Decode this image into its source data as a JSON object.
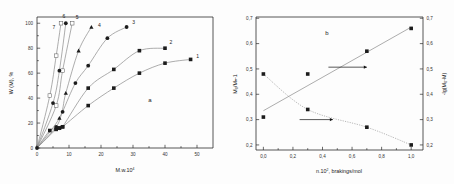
{
  "figure": {
    "panel_a_label": "a",
    "panel_b_label": "b"
  },
  "chart_data": [
    {
      "type": "line",
      "panel": "a",
      "title": "",
      "xlabel": "M.w.10",
      "xlabel_sup": "4",
      "ylabel": "W (M), %",
      "xlim": [
        0,
        55
      ],
      "ylim": [
        0,
        105
      ],
      "xticks": [
        0,
        10,
        20,
        30,
        40,
        50
      ],
      "yticks": [
        0,
        20,
        40,
        60,
        80,
        100
      ],
      "grid": false,
      "legend": "curve numbers 1-7 placed at curve ends",
      "series": [
        {
          "name": "1",
          "label": "1",
          "marker": "square",
          "x": [
            0,
            4,
            6,
            7,
            8,
            16,
            24,
            32,
            40,
            48
          ],
          "y": [
            0,
            14,
            15,
            16,
            17,
            34,
            48,
            60,
            68,
            71
          ]
        },
        {
          "name": "2",
          "label": "2",
          "marker": "square",
          "x": [
            0,
            6,
            7,
            8,
            16,
            24,
            32,
            40
          ],
          "y": [
            0,
            15,
            16,
            17,
            48,
            63,
            78,
            80
          ]
        },
        {
          "name": "3",
          "label": "3",
          "marker": "circle",
          "x": [
            0,
            6,
            8,
            12,
            16,
            22,
            28
          ],
          "y": [
            0,
            17,
            29,
            52,
            66,
            88,
            97
          ]
        },
        {
          "name": "4",
          "label": "4",
          "marker": "triangle",
          "x": [
            0,
            7,
            9,
            13,
            17
          ],
          "y": [
            0,
            24,
            44,
            78,
            97
          ]
        },
        {
          "name": "5",
          "label": "5",
          "marker": "open",
          "x": [
            0,
            6,
            8,
            11
          ],
          "y": [
            0,
            34,
            62,
            100
          ]
        },
        {
          "name": "6",
          "label": "6",
          "marker": "circle",
          "x": [
            0,
            5,
            7,
            9
          ],
          "y": [
            0,
            36,
            62,
            100
          ]
        },
        {
          "name": "7",
          "label": "7",
          "marker": "open",
          "x": [
            0,
            4,
            6,
            7.5
          ],
          "y": [
            0,
            42,
            74,
            100
          ]
        }
      ]
    },
    {
      "type": "scatter",
      "panel": "b",
      "title": "",
      "xlabel": "n.10",
      "xlabel_sup": "2",
      "xlabel_tail": ", brakings/mol",
      "ylabel_left": "M₀/Mₙ-1",
      "ylabel_right": "-lg(M₀-M)",
      "xlim": [
        -0.05,
        1.08
      ],
      "ylim": [
        0.18,
        0.705
      ],
      "xticks": [
        0.0,
        0.2,
        0.4,
        0.6,
        0.8,
        1.0
      ],
      "xticklabels": [
        "0,0",
        "0,2",
        "0,4",
        "0,6",
        "0,8",
        "1,0"
      ],
      "yticks": [
        0.2,
        0.3,
        0.4,
        0.5,
        0.6,
        0.7
      ],
      "yticklabels": [
        "0,2",
        "0,3",
        "0,4",
        "0,5",
        "0,6",
        "0,7"
      ],
      "grid": false,
      "series": [
        {
          "name": "rising",
          "style": "solid",
          "marker": "square",
          "x": [
            0.0,
            0.3,
            0.7,
            1.0
          ],
          "y": [
            0.31,
            0.48,
            0.57,
            0.66
          ],
          "fit_x": [
            0.0,
            1.0
          ],
          "fit_y": [
            0.335,
            0.665
          ]
        },
        {
          "name": "falling",
          "style": "dotted",
          "marker": "square",
          "x": [
            0.0,
            0.3,
            0.7,
            1.0
          ],
          "y": [
            0.48,
            0.34,
            0.27,
            0.2
          ]
        }
      ],
      "annotations": [
        {
          "name": "arrow-right-upper",
          "x_from": 0.44,
          "x_to": 0.7,
          "y": 0.507
        },
        {
          "name": "arrow-right-lower",
          "x_from": 0.245,
          "x_to": 0.47,
          "y": 0.3
        }
      ]
    }
  ]
}
